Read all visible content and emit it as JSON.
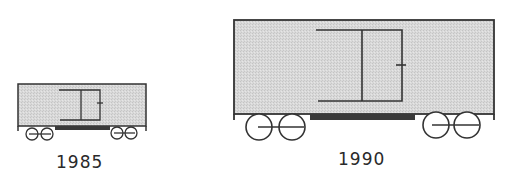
{
  "figure": {
    "colors": {
      "body_fill": "#d6d6d6",
      "stroke": "#333333",
      "frame_bar": "#3a3a3a",
      "label": "#2a2a2a"
    },
    "cars": [
      {
        "label": "1985",
        "size": "small",
        "body": {
          "x": 18,
          "y": 84,
          "w": 128,
          "h": 42
        },
        "frame_bar": {
          "x": 55,
          "y": 126,
          "w": 55,
          "h": 4
        },
        "wheels": [
          [
            32,
            134,
            6
          ],
          [
            47,
            134,
            6
          ],
          [
            117,
            133,
            6
          ],
          [
            131,
            133,
            6
          ]
        ]
      },
      {
        "label": "1990",
        "size": "large",
        "body": {
          "x": 234,
          "y": 20,
          "w": 260,
          "h": 94
        },
        "frame_bar": {
          "x": 310,
          "y": 114,
          "w": 105,
          "h": 6
        },
        "wheels": [
          [
            259,
            127,
            13
          ],
          [
            292,
            127,
            13
          ],
          [
            436,
            125,
            13
          ],
          [
            467,
            125,
            13
          ]
        ]
      }
    ]
  }
}
